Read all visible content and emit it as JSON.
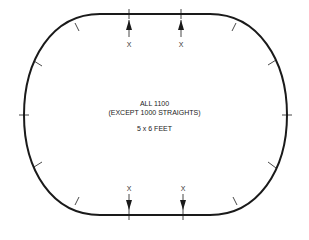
{
  "diagram": {
    "title_line1": "ALL 1100",
    "title_line2": "(EXCEPT 1000 STRAIGHTS)",
    "size_label": "5 x 6 FEET",
    "track_color": "#1a1a1a",
    "markers": [
      {
        "label": "X",
        "position": "top-left"
      },
      {
        "label": "X",
        "position": "top-right"
      },
      {
        "label": "X",
        "position": "bottom-left"
      },
      {
        "label": "X",
        "position": "bottom-right"
      }
    ]
  }
}
